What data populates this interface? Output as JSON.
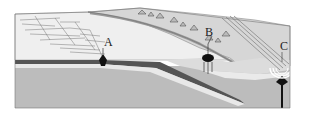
{
  "diagram": {
    "labels": {
      "a": "A",
      "b": "B",
      "c": "C"
    },
    "features": {
      "a": "mid-ocean ridge",
      "b": "subduction-zone volcanic mountains",
      "c": "hotspot volcano chain"
    },
    "colors": {
      "ocean_surface": "#f2f2f2",
      "land": "#cfcfcf",
      "mantle": "#b9b9b9",
      "crust_dark": "#555555",
      "crust_light": "#e6e6e6",
      "ink": "#1a1a1a"
    }
  }
}
